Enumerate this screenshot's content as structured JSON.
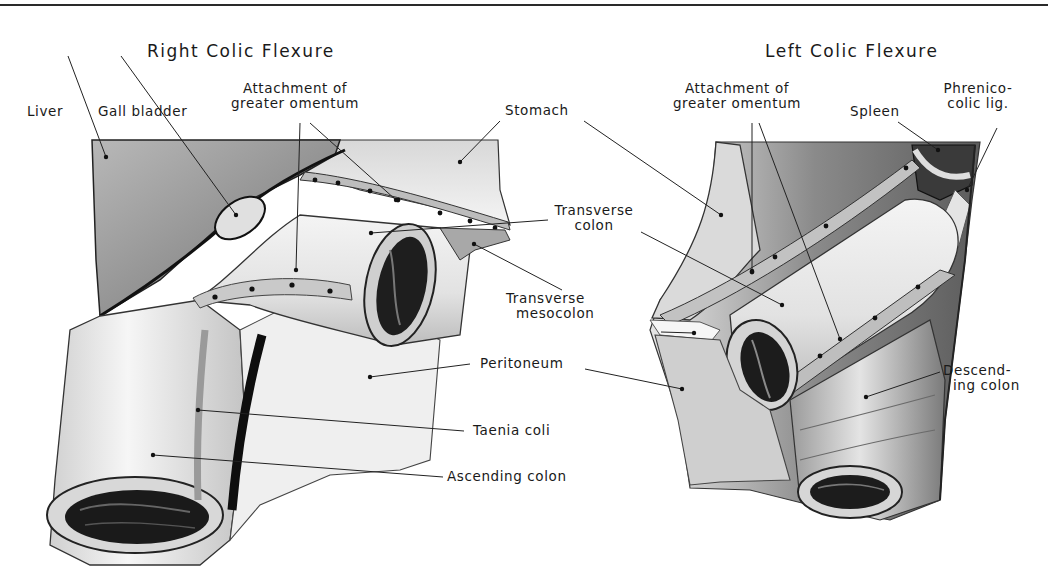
{
  "plate": {
    "figures": [
      {
        "title": "Right Colic Flexure",
        "labels": {
          "liver": "Liver",
          "gall_bladder": "Gall bladder",
          "attachment_line1": "Attachment of",
          "attachment_line2": "greater omentum",
          "stomach": "Stomach",
          "transverse_colon_line1": "Transverse",
          "transverse_colon_line2": "colon",
          "transverse_mesocolon_line1": "Transverse",
          "transverse_mesocolon_line2": "mesocolon",
          "peritoneum": "Peritoneum",
          "taenia_coli": "Taenia coli",
          "ascending_colon": "Ascending colon"
        }
      },
      {
        "title": "Left Colic Flexure",
        "labels": {
          "attachment_line1": "Attachment of",
          "attachment_line2": "greater omentum",
          "spleen": "Spleen",
          "phrenicocolic_line1": "Phrenico-",
          "phrenicocolic_line2": "colic lig.",
          "descending_line1": "Descend-",
          "descending_line2": "ing colon"
        }
      }
    ],
    "colors": {
      "ink": "#1a1a1a",
      "tissue_light": "#e8e8e8",
      "tissue_mid": "#b5b5b5",
      "tissue_dark": "#5a5a5a",
      "lumen": "#1e1e1e",
      "omentum_band": "#c8c8c8"
    }
  }
}
